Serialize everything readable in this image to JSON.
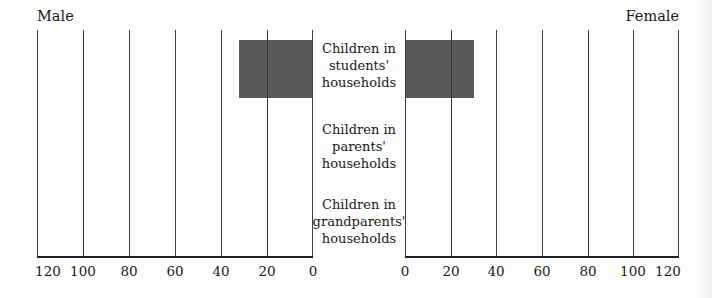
{
  "figure": {
    "male_title": "Male",
    "female_title": "Female"
  },
  "axis": {
    "left_ticks": [
      "120",
      "100",
      "80",
      "60",
      "40",
      "20",
      "0"
    ],
    "right_ticks": [
      "0",
      "20",
      "40",
      "60",
      "80",
      "100",
      "120"
    ]
  },
  "categories": [
    {
      "line1": "Children in",
      "line2": "students'",
      "line3": "households"
    },
    {
      "line1": "Children in",
      "line2": "parents'",
      "line3": "households"
    },
    {
      "line1": "Children in",
      "line2": "grandparents'",
      "line3": "households"
    }
  ],
  "chart_data": {
    "type": "bar",
    "subtype": "population-pyramid",
    "title": "",
    "categories": [
      "Children in students' households",
      "Children in parents' households",
      "Children in grandparents' households"
    ],
    "series": [
      {
        "name": "Male",
        "side": "left",
        "values": [
          32,
          0,
          0
        ]
      },
      {
        "name": "Female",
        "side": "right",
        "values": [
          30,
          0,
          0
        ]
      }
    ],
    "axis_range": [
      0,
      120
    ],
    "tick_interval": 20,
    "tick_labels_left": [
      120,
      100,
      80,
      60,
      40,
      20,
      0
    ],
    "tick_labels_right": [
      0,
      20,
      40,
      60,
      80,
      100,
      120
    ],
    "bar_color": "#595959",
    "gridlines": "vertical",
    "legend_position": "top-outer",
    "left_side_label": "Male",
    "right_side_label": "Female"
  }
}
